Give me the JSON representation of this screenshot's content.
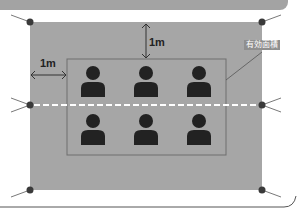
{
  "diagram": {
    "labels": {
      "top_distance": "1m",
      "left_distance": "1m",
      "effective_area": "有効面積"
    },
    "colors": {
      "background": "#ffffff",
      "floor": "#a6a6a6",
      "topbar": "#a3a3a3",
      "inner_border": "#6e6e6e",
      "person": "#222222",
      "dot": "#3a3a3a",
      "dashed_line": "#ffffff"
    },
    "people": {
      "rows": 2,
      "columns": 3,
      "count": 6
    },
    "icons": [
      "person-icon",
      "corner-anchor-icon",
      "double-arrow-icon"
    ]
  }
}
